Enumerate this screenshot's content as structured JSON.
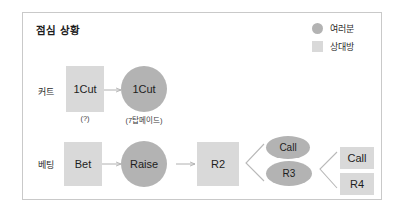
{
  "panel": {
    "title": "점심 상황",
    "border_color": "#c9c9c9",
    "background": "#ffffff"
  },
  "legend": {
    "items": [
      {
        "label": "여러분",
        "shape": "circle",
        "color": "#b3b3b3",
        "icon": "circle-swatch-icon"
      },
      {
        "label": "상대방",
        "shape": "square",
        "color": "#d9d9d9",
        "icon": "square-swatch-icon"
      }
    ]
  },
  "rows": [
    {
      "id": "cut",
      "label": "커트"
    },
    {
      "id": "bet",
      "label": "베팅"
    }
  ],
  "nodes": {
    "cut_own": {
      "text": "1Cut",
      "shape": "square",
      "owner": "상대방",
      "caption": "(?)"
    },
    "cut_you": {
      "text": "1Cut",
      "shape": "circle",
      "owner": "여러분",
      "caption": "(7탑메이드)"
    },
    "bet": {
      "text": "Bet",
      "shape": "square",
      "owner": "상대방"
    },
    "raise": {
      "text": "Raise",
      "shape": "circle",
      "owner": "여러분"
    },
    "r2": {
      "text": "R2",
      "shape": "square",
      "owner": "상대방"
    },
    "call_top": {
      "text": "Call",
      "shape": "ellipse",
      "owner": "여러분"
    },
    "r3": {
      "text": "R3",
      "shape": "ellipse",
      "owner": "여러분"
    },
    "call_right": {
      "text": "Call",
      "shape": "square",
      "owner": "상대방"
    },
    "r4": {
      "text": "R4",
      "shape": "square",
      "owner": "상대방"
    }
  },
  "colors": {
    "own_square": "#d9d9d9",
    "you_circle": "#b3b3b3",
    "arrow": "#b0b0b0",
    "text": "#1d1d1d"
  }
}
